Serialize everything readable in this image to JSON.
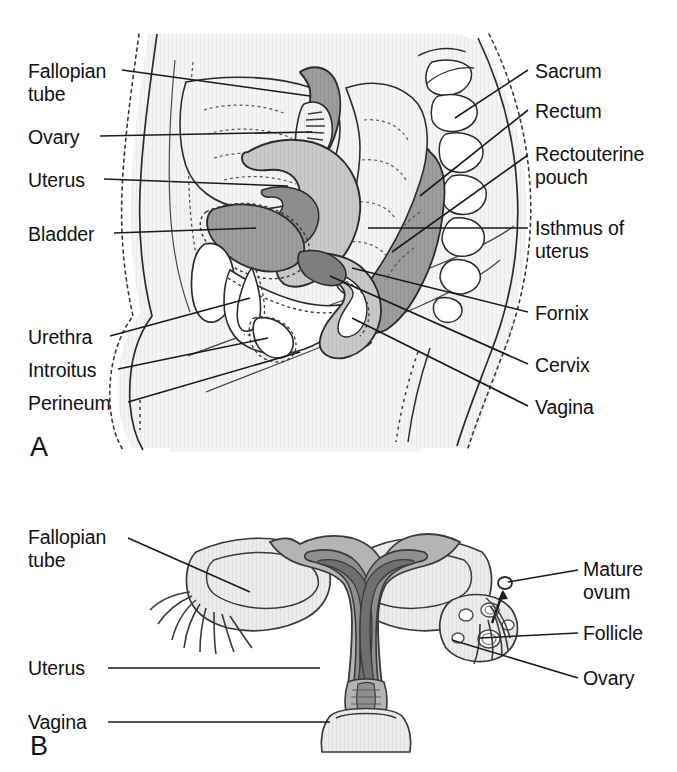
{
  "figure": {
    "background_color": "#ffffff",
    "line_color": "#1a1a1a",
    "text_color": "#111111"
  },
  "panels": [
    {
      "letter": "A",
      "name": "panel-a-sagittal-section",
      "description": "Midsagittal section of the female pelvis",
      "labels_left": [
        {
          "id": "fallopian-tube",
          "text": "Fallopian\ntube",
          "x": 28,
          "y": 60
        },
        {
          "id": "ovary",
          "text": "Ovary",
          "x": 28,
          "y": 130
        },
        {
          "id": "uterus",
          "text": "Uterus",
          "x": 28,
          "y": 172
        },
        {
          "id": "bladder",
          "text": "Bladder",
          "x": 28,
          "y": 226
        },
        {
          "id": "urethra",
          "text": "Urethra",
          "x": 28,
          "y": 329
        },
        {
          "id": "introitus",
          "text": "Introitus",
          "x": 28,
          "y": 362
        },
        {
          "id": "perineum",
          "text": "Perineum",
          "x": 28,
          "y": 395
        }
      ],
      "labels_right": [
        {
          "id": "sacrum",
          "text": "Sacrum",
          "x": 535,
          "y": 63
        },
        {
          "id": "rectum",
          "text": "Rectum",
          "x": 535,
          "y": 103
        },
        {
          "id": "rectouterine-pouch",
          "text": "Rectouterine\npouch",
          "x": 535,
          "y": 146
        },
        {
          "id": "isthmus-of-uterus",
          "text": "Isthmus of\nuterus",
          "x": 535,
          "y": 220
        },
        {
          "id": "fornix",
          "text": "Fornix",
          "x": 535,
          "y": 305
        },
        {
          "id": "cervix",
          "text": "Cervix",
          "x": 535,
          "y": 358
        },
        {
          "id": "vagina",
          "text": "Vagina",
          "x": 535,
          "y": 400
        }
      ],
      "letter_pos": {
        "x": 30,
        "y": 437
      }
    },
    {
      "letter": "B",
      "name": "panel-b-frontal-section",
      "description": "Frontal (coronal) section of uterus, fallopian tubes and ovaries",
      "labels_left": [
        {
          "id": "fallopian-tube-b",
          "text": "Fallopian\ntube",
          "x": 28,
          "y": 528
        },
        {
          "id": "uterus-b",
          "text": "Uterus",
          "x": 28,
          "y": 661
        },
        {
          "id": "vagina-b",
          "text": "Vagina",
          "x": 28,
          "y": 715
        }
      ],
      "labels_right": [
        {
          "id": "mature-ovum",
          "text": "Mature\novum",
          "x": 583,
          "y": 560
        },
        {
          "id": "follicle",
          "text": "Follicle",
          "x": 583,
          "y": 627
        },
        {
          "id": "ovary-b",
          "text": "Ovary",
          "x": 583,
          "y": 672
        }
      ],
      "letter_pos": {
        "x": 30,
        "y": 736
      }
    }
  ],
  "palette": {
    "outline": "#2b2b2b",
    "body_fill": "#f3f3f3",
    "light_gray": "#e3e3e3",
    "mid_gray": "#c6c6c6",
    "dark_gray": "#9a9a9a",
    "darker_gray": "#8a8a8a",
    "white": "#ffffff"
  }
}
